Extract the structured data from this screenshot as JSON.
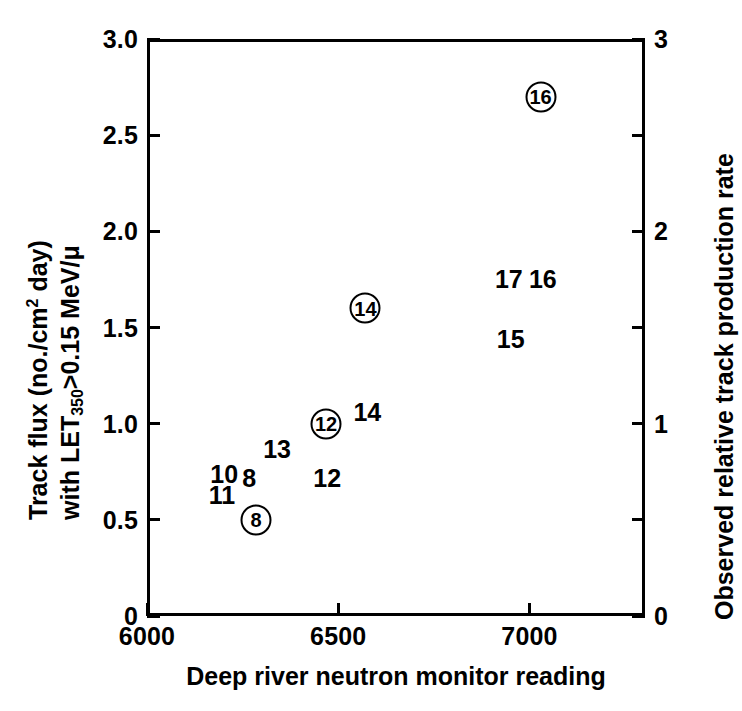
{
  "figure": {
    "background_color": "#ffffff",
    "ink_color": "#000000"
  },
  "axes": {
    "left": {
      "title_line1": "Track flux (no./cm2 day)",
      "title_line2": "with LET350>0.15 MeV/μ",
      "ticks": [
        "0",
        "0.5",
        "1.0",
        "1.5",
        "2.0",
        "2.5",
        "3.0"
      ],
      "range": [
        0,
        3.0
      ]
    },
    "right": {
      "title": "Observed relative track production rate",
      "ticks": [
        "0",
        "1",
        "2",
        "3"
      ],
      "range": [
        0,
        3
      ]
    },
    "bottom": {
      "title": "Deep river neutron monitor reading",
      "ticks": [
        "6000",
        "6500",
        "7000"
      ],
      "range": [
        6000,
        7302
      ]
    }
  },
  "chart_data": {
    "type": "scatter",
    "title": "",
    "xlabel": "Deep river neutron monitor reading",
    "ylabel": "Track flux (no./cm2 day) with LET350>0.15 MeV/μ",
    "y2label": "Observed relative track production rate",
    "xlim": [
      6000,
      7302
    ],
    "ylim": [
      0,
      3.0
    ],
    "y2lim": [
      0,
      3
    ],
    "grid": false,
    "legend": null,
    "xticks": [
      6000,
      6500,
      7000
    ],
    "yticks": [
      0,
      0.5,
      1.0,
      1.5,
      2.0,
      2.5,
      3.0
    ],
    "y2ticks": [
      0,
      1,
      2,
      3
    ],
    "y_minor_ticks": [
      0.5,
      1.5,
      2.5
    ],
    "marker_styles": {
      "circled": "numeral enclosed in an open circle",
      "plain": "bare numeral"
    },
    "points": [
      {
        "label": "8",
        "style": "circled",
        "x": 6285,
        "y": 0.5
      },
      {
        "label": "11",
        "style": "plain",
        "x": 6196,
        "y": 0.63
      },
      {
        "label": "10",
        "style": "plain",
        "x": 6202,
        "y": 0.74
      },
      {
        "label": "8",
        "style": "plain",
        "x": 6267,
        "y": 0.72
      },
      {
        "label": "13",
        "style": "plain",
        "x": 6340,
        "y": 0.87
      },
      {
        "label": "12",
        "style": "plain",
        "x": 6471,
        "y": 0.72
      },
      {
        "label": "12",
        "style": "circled",
        "x": 6468,
        "y": 1.0
      },
      {
        "label": "14",
        "style": "plain",
        "x": 6576,
        "y": 1.06
      },
      {
        "label": "14",
        "style": "circled",
        "x": 6571,
        "y": 1.6
      },
      {
        "label": "15",
        "style": "plain",
        "x": 6951,
        "y": 1.44
      },
      {
        "label": "17",
        "style": "plain",
        "x": 6946,
        "y": 1.75
      },
      {
        "label": "16",
        "style": "plain",
        "x": 7035,
        "y": 1.75
      },
      {
        "label": "16",
        "style": "circled",
        "x": 7029,
        "y": 2.7
      }
    ]
  }
}
